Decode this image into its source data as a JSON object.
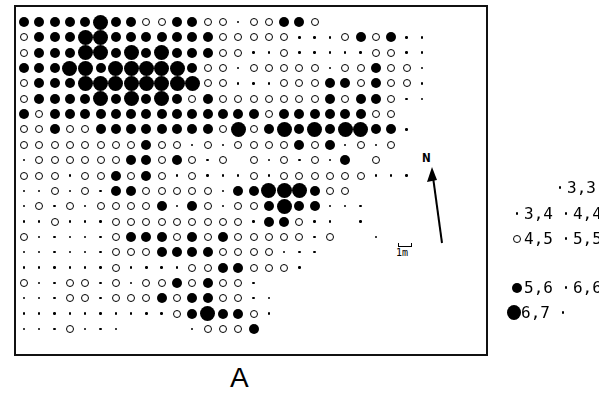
{
  "figure": {
    "label": "A",
    "north_label": "N",
    "scale_label": "1m"
  },
  "symbols": {
    "L": "large-filled-circle",
    "B": "filled-circle",
    "o": "open-circle",
    ".": "small-dot",
    "_": "empty"
  },
  "legend": [
    {
      "entries": [
        {
          "symbol": ".",
          "text": "3,3"
        }
      ],
      "x": 553,
      "y": 186
    },
    {
      "entries": [
        {
          "symbol": ".",
          "text": "3,4"
        },
        {
          "symbol": ".",
          "text": "4,4"
        }
      ],
      "x": 510,
      "y": 212
    },
    {
      "entries": [
        {
          "symbol": "o",
          "text": "4,5"
        },
        {
          "symbol": ".",
          "text": "5,5"
        }
      ],
      "x": 510,
      "y": 237
    },
    {
      "entries": [
        {
          "symbol": "B",
          "text": "5,6"
        },
        {
          "symbol": ".",
          "text": "6,6"
        }
      ],
      "x": 510,
      "y": 286
    },
    {
      "entries": [
        {
          "symbol": "L",
          "text": "6,7"
        },
        {
          "symbol": ".",
          "text": ""
        }
      ],
      "x": 507,
      "y": 311
    }
  ],
  "grid": {
    "origin_x": 24,
    "origin_y": 22,
    "col_step": 15.3,
    "row_step": 15.35,
    "rows": [
      "BBBBBLBBooBBoo.ooBBo",
      "oBBBLLBBBBBBBooooo...oBoB..",
      "oBBBLLBLBLBBBoo..o.....oo..",
      "BBBLLBLLLLLBoo.ooooo.ooBoo.",
      "oBBBLLLLLLLLoo...oooBBoBoo.",
      "oBBBBLBLBLBoBoooooooBoBBo..",
      "BoBBBBBBBBBBBBBBoBBBBBBoo",
      "ooBooBBBBBBBBoLoBLBLBLLBB.",
      "ooooooooBoo.o.ooooBoB.o.o",
      ".ooooooBBoBo.o_o.o.o.B_o",
      "ooo.ooBoBo.o...o.oooooo...",
      "..o.o.BBooooo.BBLLLBoo",
      ".o.o.ooooB.Bo.ooBLBB...",
      "..o...ooooooooo.BBo.._.",
      "o.....oBBBoBoBooooo.o__.",
      "......oooBBBBoooo...",
      "......o....ooBBooo.",
      "o..oo.o.ooBoBoo.",
      "...oo.oooBoBBoo..",
      "..........oBLBBo.",
      "...o...____.oooB"
    ]
  }
}
